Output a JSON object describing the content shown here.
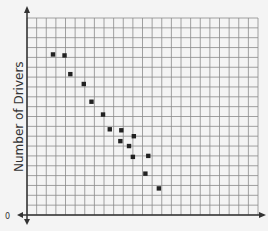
{
  "chart_data": {
    "type": "scatter",
    "title": "",
    "xlabel": "",
    "ylabel": "Number of Drivers",
    "origin_label": "0",
    "grid": true,
    "grid_columns": 24,
    "grid_rows": 20,
    "xlim": [
      0,
      24
    ],
    "ylim": [
      0,
      20
    ],
    "points": [
      {
        "x": 2.7,
        "y": 16.3
      },
      {
        "x": 3.9,
        "y": 16.2
      },
      {
        "x": 4.5,
        "y": 14.3
      },
      {
        "x": 5.9,
        "y": 13.3
      },
      {
        "x": 6.7,
        "y": 11.5
      },
      {
        "x": 7.9,
        "y": 10.2
      },
      {
        "x": 8.6,
        "y": 8.7
      },
      {
        "x": 9.8,
        "y": 8.6
      },
      {
        "x": 11.1,
        "y": 8.0
      },
      {
        "x": 9.7,
        "y": 7.5
      },
      {
        "x": 10.6,
        "y": 7.0
      },
      {
        "x": 11.0,
        "y": 5.9
      },
      {
        "x": 12.6,
        "y": 6.0
      },
      {
        "x": 12.3,
        "y": 4.2
      },
      {
        "x": 13.7,
        "y": 2.7
      }
    ]
  },
  "colors": {
    "grid": "#8a8a8a",
    "axis": "#333333",
    "point": "#222222",
    "background": "#f4f4f4"
  }
}
